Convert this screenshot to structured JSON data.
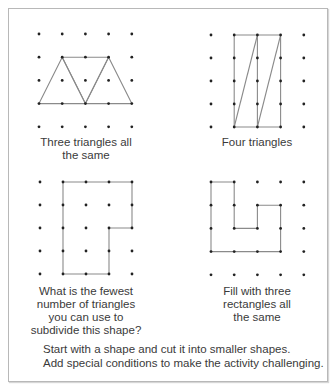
{
  "header_fragment": "",
  "style": {
    "dot_color": "#222222",
    "line_color": "#8a8a8a",
    "frame_color": "#b8b8b8"
  },
  "panels": [
    {
      "id": "three-triangles",
      "caption": "Three triangles all\nthe same",
      "grid": {
        "origin": [
          39,
          34
        ],
        "spacing": [
          23.2,
          23.2
        ],
        "cols": 5,
        "rows": 5
      },
      "shapes": [
        {
          "type": "polygon",
          "points": [
            [
              0,
              3
            ],
            [
              1,
              1
            ],
            [
              2,
              3
            ]
          ]
        },
        {
          "type": "polygon",
          "points": [
            [
              1,
              1
            ],
            [
              3,
              1
            ],
            [
              2,
              3
            ]
          ]
        },
        {
          "type": "polygon",
          "points": [
            [
              2,
              3
            ],
            [
              3,
              1
            ],
            [
              4,
              3
            ]
          ]
        }
      ],
      "caption_pos": {
        "cx": 86,
        "top": 136
      }
    },
    {
      "id": "four-triangles",
      "caption": "Four triangles",
      "grid": {
        "origin": [
          211,
          35
        ],
        "spacing": [
          23.2,
          23.0
        ],
        "cols": 5,
        "rows": 5
      },
      "shapes": [
        {
          "type": "polygon",
          "points": [
            [
              1,
              0
            ],
            [
              3,
              0
            ],
            [
              3,
              4
            ],
            [
              1,
              4
            ]
          ]
        },
        {
          "type": "line",
          "points": [
            [
              1,
              4
            ],
            [
              2,
              0
            ]
          ]
        },
        {
          "type": "line",
          "points": [
            [
              2,
              0
            ],
            [
              2,
              4
            ]
          ]
        },
        {
          "type": "line",
          "points": [
            [
              2,
              4
            ],
            [
              3,
              0
            ]
          ]
        }
      ],
      "caption_pos": {
        "cx": 257,
        "top": 136
      }
    },
    {
      "id": "fewest-triangles",
      "caption": "What is the fewest\nnumber of triangles\nyou can use to\nsubdivide this shape?",
      "grid": {
        "origin": [
          40,
          182
        ],
        "spacing": [
          23.0,
          23.0
        ],
        "cols": 5,
        "rows": 5
      },
      "shapes": [
        {
          "type": "polygon",
          "points": [
            [
              1,
              0
            ],
            [
              4,
              0
            ],
            [
              4,
              2
            ],
            [
              3,
              2
            ],
            [
              3,
              4
            ],
            [
              1,
              4
            ]
          ]
        }
      ],
      "caption_pos": {
        "cx": 86,
        "top": 285
      }
    },
    {
      "id": "three-rectangles",
      "caption": "Fill with three\nrectangles all\nthe same",
      "grid": {
        "origin": [
          211,
          182
        ],
        "spacing": [
          23.2,
          23.2
        ],
        "cols": 5,
        "rows": 5
      },
      "shapes": [
        {
          "type": "polygon",
          "points": [
            [
              0,
              0
            ],
            [
              1,
              0
            ],
            [
              1,
              2
            ],
            [
              2,
              2
            ],
            [
              2,
              1
            ],
            [
              3,
              1
            ],
            [
              3,
              3
            ],
            [
              0,
              3
            ]
          ]
        }
      ],
      "caption_pos": {
        "cx": 257,
        "top": 285
      }
    }
  ],
  "footer": {
    "line1": "Start with a shape and cut it into smaller shapes.",
    "line2": "Add special conditions to make the activity challenging."
  }
}
